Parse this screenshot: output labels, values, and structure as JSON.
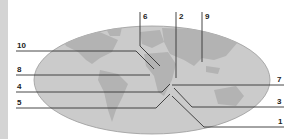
{
  "diagram": {
    "type": "world-map-labels",
    "colors": {
      "ocean": "#c9c9c9",
      "land": "#b0b0b0",
      "line": "#333333",
      "strip": "#d4d4d4"
    },
    "labels": {
      "left": [
        "10",
        "8",
        "4",
        "5"
      ],
      "top": [
        "6",
        "2",
        "9"
      ],
      "right": [
        "7",
        "3",
        "1"
      ]
    }
  }
}
